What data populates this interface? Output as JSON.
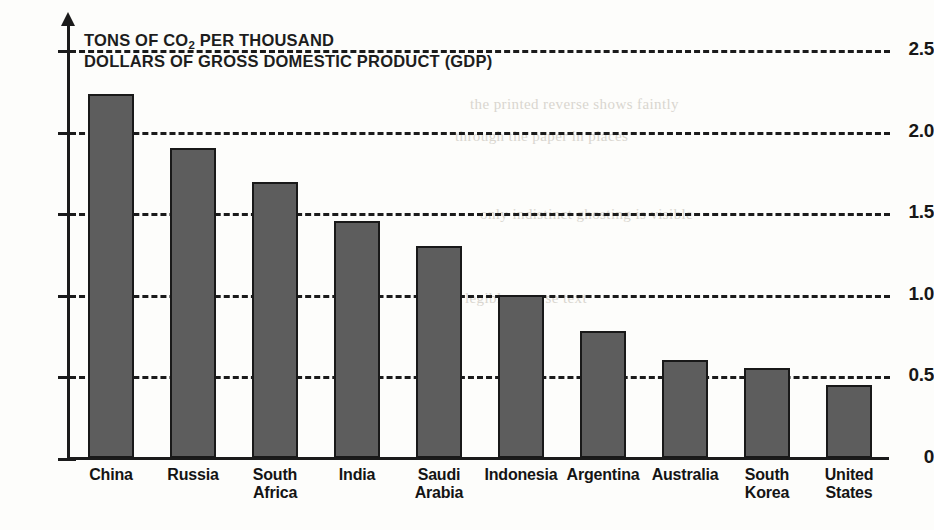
{
  "chart_data": {
    "type": "bar",
    "title": "TONS OF CO2 PER THOUSAND DOLLARS OF GROSS DOMESTIC PRODUCT (GDP)",
    "title_line1_pre": "TONS OF CO",
    "title_line1_sub": "2",
    "title_line1_post": " PER THOUSAND",
    "title_line2": "DOLLARS OF GROSS DOMESTIC PRODUCT (GDP)",
    "xlabel": "",
    "ylabel": "",
    "ylim": [
      0,
      2.6
    ],
    "grid": true,
    "grid_style": "dashed-horizontal",
    "legend": "none",
    "categories": [
      "China",
      "Russia",
      "South Africa",
      "India",
      "Saudi Arabia",
      "Indonesia",
      "Argentina",
      "Australia",
      "South Korea",
      "United States"
    ],
    "values": [
      2.23,
      1.9,
      1.69,
      1.45,
      1.3,
      1.0,
      0.78,
      0.6,
      0.55,
      0.45
    ],
    "ytick_labels": [
      "2.5",
      "2.0",
      "1.5",
      "1.0",
      "0.5",
      "0"
    ],
    "ytick_values": [
      2.5,
      2.0,
      1.5,
      1.0,
      0.5,
      0
    ],
    "gridline_values": [
      2.5,
      2.0,
      1.5,
      1.0,
      0.5
    ],
    "bar_fill_color": "#5d5d5d",
    "bar_edge_color": "#191919",
    "axis_color": "#1b1b1b",
    "background_color": "#fdfdfb"
  },
  "axis": {
    "ticks": [
      {
        "label": "2.5"
      },
      {
        "label": "2.0"
      },
      {
        "label": "1.5"
      },
      {
        "label": "1.0"
      },
      {
        "label": "0.5"
      },
      {
        "label": "0"
      }
    ]
  },
  "categories": [
    {
      "line1": "China",
      "line2": ""
    },
    {
      "line1": "Russia",
      "line2": ""
    },
    {
      "line1": "South",
      "line2": "Africa"
    },
    {
      "line1": "India",
      "line2": ""
    },
    {
      "line1": "Saudi",
      "line2": "Arabia"
    },
    {
      "line1": "Indonesia",
      "line2": ""
    },
    {
      "line1": "Argentina",
      "line2": ""
    },
    {
      "line1": "Australia",
      "line2": ""
    },
    {
      "line1": "South",
      "line2": "Korea"
    },
    {
      "line1": "United",
      "line2": "States"
    }
  ],
  "page_bleed": [
    {
      "text": "the printed reverse shows faintly"
    },
    {
      "text": "through the paper in places"
    },
    {
      "text": "only indistinct ghosting is visible"
    },
    {
      "text": "no legible reverse text"
    }
  ]
}
